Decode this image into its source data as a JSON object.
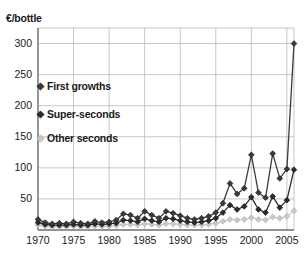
{
  "chart_data": {
    "type": "line",
    "title": "",
    "xlabel": "",
    "ylabel": "€/bottle",
    "ylim": [
      0,
      325
    ],
    "xlim": [
      1970,
      2006
    ],
    "grid": true,
    "legend_position": "inside-top-left",
    "x": [
      1970,
      1971,
      1972,
      1973,
      1974,
      1975,
      1976,
      1977,
      1978,
      1979,
      1980,
      1981,
      1982,
      1983,
      1984,
      1985,
      1986,
      1987,
      1988,
      1989,
      1990,
      1991,
      1992,
      1993,
      1994,
      1995,
      1996,
      1997,
      1998,
      1999,
      2000,
      2001,
      2002,
      2003,
      2004,
      2005,
      2006
    ],
    "xtick_labels": [
      "1970",
      "1975",
      "1980",
      "1985",
      "1990",
      "1995",
      "2000",
      "2005"
    ],
    "xtick_values": [
      1970,
      1975,
      1980,
      1985,
      1990,
      1995,
      2000,
      2005
    ],
    "ytick_labels": [
      "50",
      "100",
      "150",
      "200",
      "250",
      "300"
    ],
    "ytick_values": [
      50,
      100,
      150,
      200,
      250,
      300
    ],
    "series": [
      {
        "name": "First growths",
        "color": "#3a3a3a",
        "marker": "diamond",
        "values": [
          17,
          12,
          10,
          11,
          10,
          13,
          11,
          10,
          14,
          12,
          13,
          16,
          26,
          24,
          19,
          30,
          24,
          19,
          30,
          27,
          23,
          19,
          17,
          19,
          22,
          28,
          43,
          75,
          58,
          67,
          121,
          60,
          52,
          123,
          83,
          98,
          300
        ]
      },
      {
        "name": "Super-seconds",
        "color": "#2b2b2b",
        "marker": "diamond",
        "values": [
          12,
          9,
          8,
          8,
          8,
          9,
          8,
          8,
          10,
          9,
          10,
          11,
          16,
          15,
          13,
          18,
          15,
          13,
          19,
          18,
          15,
          13,
          12,
          13,
          15,
          19,
          28,
          40,
          33,
          38,
          53,
          33,
          28,
          54,
          36,
          48,
          97
        ]
      },
      {
        "name": "Other seconds",
        "color": "#c9c9c9",
        "marker": "diamond",
        "values": [
          8,
          6,
          5,
          5,
          5,
          6,
          5,
          5,
          6,
          6,
          6,
          7,
          9,
          9,
          8,
          10,
          9,
          8,
          10,
          10,
          9,
          8,
          8,
          8,
          9,
          11,
          14,
          17,
          16,
          17,
          20,
          17,
          16,
          21,
          19,
          22,
          31
        ]
      }
    ]
  },
  "legend": {
    "items": [
      {
        "label": "First growths",
        "color": "#3a3a3a"
      },
      {
        "label": "Super-seconds",
        "color": "#2b2b2b"
      },
      {
        "label": "Other seconds",
        "color": "#c9c9c9"
      }
    ]
  },
  "axis": {
    "y_unit_label": "€/bottle"
  }
}
